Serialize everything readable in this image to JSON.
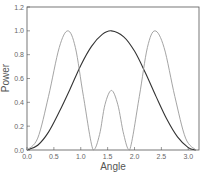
{
  "chart_data": {
    "type": "line",
    "title": "",
    "xlabel": "Angle",
    "ylabel": "Power",
    "xlim": [
      0,
      3.2
    ],
    "ylim": [
      0,
      1.2
    ],
    "grid": false,
    "legend": null,
    "x_ticks": [
      "0.0",
      "0.5",
      "1.0",
      "1.5",
      "2.0",
      "2.5",
      "3.0"
    ],
    "y_ticks": [
      "0.0",
      "0.2",
      "0.4",
      "0.6",
      "0.8",
      "1.0",
      "1.2"
    ],
    "series": [
      {
        "name": "dark curve",
        "color": "#333333",
        "x": [
          0,
          0.2,
          0.4,
          0.6,
          0.8,
          1.0,
          1.2,
          1.4,
          1.571,
          1.8,
          2.0,
          2.2,
          2.4,
          2.6,
          2.8,
          3.0,
          3.1416
        ],
        "y": [
          0,
          0.04,
          0.15,
          0.32,
          0.51,
          0.71,
          0.87,
          0.97,
          1.0,
          0.95,
          0.83,
          0.65,
          0.45,
          0.26,
          0.11,
          0.02,
          0
        ]
      },
      {
        "name": "light curve",
        "color": "#9a9a9a",
        "x": [
          0,
          0.2,
          0.4,
          0.6,
          0.76,
          0.9,
          1.05,
          1.23,
          1.35,
          1.45,
          1.571,
          1.69,
          1.8,
          1.91,
          2.09,
          2.24,
          2.38,
          2.55,
          2.75,
          2.95,
          3.1416
        ],
        "y": [
          0,
          0.1,
          0.45,
          0.86,
          1.0,
          0.86,
          0.45,
          0,
          0.13,
          0.38,
          0.5,
          0.38,
          0.13,
          0,
          0.45,
          0.86,
          1.0,
          0.86,
          0.45,
          0.1,
          0
        ]
      }
    ]
  }
}
